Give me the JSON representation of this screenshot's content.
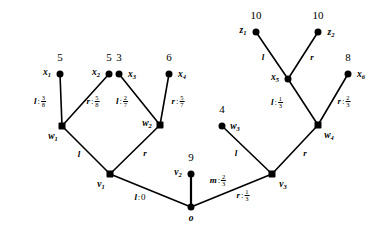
{
  "figure": {
    "type": "tree-diagram"
  },
  "nodes": [
    {
      "id": "x1",
      "label": "x",
      "sub": "1",
      "shape": "circle",
      "x": 60,
      "y": 74,
      "label_pos": "left",
      "value": "5"
    },
    {
      "id": "x2",
      "label": "x",
      "sub": "2",
      "shape": "circle",
      "x": 109,
      "y": 74,
      "label_pos": "left",
      "value": "5"
    },
    {
      "id": "x3",
      "label": "x",
      "sub": "3",
      "shape": "circle",
      "x": 119,
      "y": 74,
      "label_pos": "right",
      "value": "3"
    },
    {
      "id": "x4",
      "label": "x",
      "sub": "4",
      "shape": "circle",
      "x": 169,
      "y": 74,
      "label_pos": "right",
      "value": "6"
    },
    {
      "id": "z1",
      "label": "z",
      "sub": "1",
      "shape": "circle",
      "x": 256,
      "y": 32,
      "label_pos": "left",
      "value": "10"
    },
    {
      "id": "z2",
      "label": "z",
      "sub": "2",
      "shape": "circle",
      "x": 318,
      "y": 32,
      "label_pos": "right",
      "value": "10"
    },
    {
      "id": "x5",
      "label": "x",
      "sub": "5",
      "shape": "circle",
      "x": 288,
      "y": 79,
      "label_pos": "left",
      "value": null
    },
    {
      "id": "x6",
      "label": "x",
      "sub": "6",
      "shape": "circle",
      "x": 348,
      "y": 74,
      "label_pos": "right",
      "value": "8"
    },
    {
      "id": "w1",
      "label": "w",
      "sub": "1",
      "shape": "square",
      "x": 62,
      "y": 126,
      "label_pos": "below-left",
      "value": null
    },
    {
      "id": "w2",
      "label": "w",
      "sub": "2",
      "shape": "square",
      "x": 160,
      "y": 125,
      "label_pos": "left",
      "value": null
    },
    {
      "id": "w3",
      "label": "w",
      "sub": "3",
      "shape": "circle",
      "x": 222,
      "y": 126,
      "label_pos": "right",
      "value": "4"
    },
    {
      "id": "w4",
      "label": "w",
      "sub": "4",
      "shape": "square",
      "x": 318,
      "y": 125,
      "label_pos": "below-right",
      "value": null
    },
    {
      "id": "v1",
      "label": "v",
      "sub": "1",
      "shape": "square",
      "x": 110,
      "y": 174,
      "label_pos": "below-left",
      "value": null
    },
    {
      "id": "v2",
      "label": "v",
      "sub": "2",
      "shape": "circle",
      "x": 191,
      "y": 174,
      "label_pos": "left",
      "value": "9"
    },
    {
      "id": "v3",
      "label": "v",
      "sub": "3",
      "shape": "square",
      "x": 272,
      "y": 174,
      "label_pos": "below-right",
      "value": null
    },
    {
      "id": "o",
      "label": "o",
      "sub": "",
      "shape": "circle",
      "x": 191,
      "y": 207,
      "label_pos": "below",
      "value": null
    }
  ],
  "edges": [
    {
      "id": "e-x1-w1",
      "from": "x1",
      "to": "w1",
      "label": "l",
      "num": "3",
      "den": "8",
      "lx": 40,
      "ly": 102
    },
    {
      "id": "e-x2-w1",
      "from": "x2",
      "to": "w1",
      "label": "r",
      "num": "5",
      "den": "8",
      "lx": 93,
      "ly": 102
    },
    {
      "id": "e-x3-w2",
      "from": "x3",
      "to": "w2",
      "label": "l",
      "num": "2",
      "den": "7",
      "lx": 122,
      "ly": 102
    },
    {
      "id": "e-x4-w2",
      "from": "x4",
      "to": "w2",
      "label": "r",
      "num": "5",
      "den": "7",
      "lx": 178,
      "ly": 102
    },
    {
      "id": "e-z1-x5",
      "from": "z1",
      "to": "x5",
      "label": "l",
      "num": null,
      "den": null,
      "lx": 263,
      "ly": 57
    },
    {
      "id": "e-z2-x5",
      "from": "z2",
      "to": "x5",
      "label": "r",
      "num": null,
      "den": null,
      "lx": 312,
      "ly": 57
    },
    {
      "id": "e-x5-w4",
      "from": "x5",
      "to": "w4",
      "label": "l",
      "num": "1",
      "den": "3",
      "lx": 277,
      "ly": 103
    },
    {
      "id": "e-x6-w4",
      "from": "x6",
      "to": "w4",
      "label": "r",
      "num": "2",
      "den": "3",
      "lx": 344,
      "ly": 102
    },
    {
      "id": "e-w1-v1",
      "from": "w1",
      "to": "v1",
      "label": "l",
      "num": null,
      "den": null,
      "lx": 79,
      "ly": 154
    },
    {
      "id": "e-w2-v1",
      "from": "w2",
      "to": "v1",
      "label": "r",
      "num": null,
      "den": null,
      "lx": 145,
      "ly": 153
    },
    {
      "id": "e-w3-v3",
      "from": "w3",
      "to": "v3",
      "label": "l",
      "num": null,
      "den": null,
      "lx": 236,
      "ly": 153
    },
    {
      "id": "e-w4-v3",
      "from": "w4",
      "to": "v3",
      "label": "r",
      "num": null,
      "den": null,
      "lx": 305,
      "ly": 153
    },
    {
      "id": "e-v1-o",
      "from": "v1",
      "to": "o",
      "label": "l",
      "num": null,
      "den": null,
      "lx": 140,
      "ly": 197,
      "plain": "0"
    },
    {
      "id": "e-v2-o",
      "from": "v2",
      "to": "o",
      "label": "m",
      "num": "2",
      "den": "3",
      "lx": 218,
      "ly": 181
    },
    {
      "id": "e-v3-o",
      "from": "v3",
      "to": "o",
      "label": "r",
      "num": "1",
      "den": "3",
      "lx": 243,
      "ly": 196
    }
  ]
}
